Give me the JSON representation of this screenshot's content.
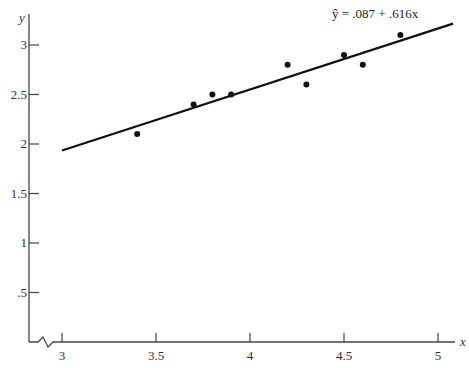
{
  "chart_data": {
    "type": "scatter",
    "title": "",
    "xlabel": "x",
    "ylabel": "y",
    "xlim": [
      3,
      5
    ],
    "ylim": [
      0,
      3
    ],
    "x_axis_break": true,
    "grid": false,
    "x_ticks": [
      3,
      3.5,
      4,
      4.5,
      5
    ],
    "x_tick_labels": [
      "3",
      "3.5",
      "4",
      "4.5",
      "5"
    ],
    "y_ticks": [
      0.5,
      1,
      1.5,
      2,
      2.5,
      3
    ],
    "y_tick_labels": [
      ".5",
      "1",
      "1.5",
      "2",
      "2.5",
      "3"
    ],
    "points": [
      {
        "x": 3.4,
        "y": 2.1
      },
      {
        "x": 3.7,
        "y": 2.4
      },
      {
        "x": 3.8,
        "y": 2.5
      },
      {
        "x": 3.9,
        "y": 2.5
      },
      {
        "x": 4.2,
        "y": 2.8
      },
      {
        "x": 4.3,
        "y": 2.6
      },
      {
        "x": 4.5,
        "y": 2.9
      },
      {
        "x": 4.6,
        "y": 2.8
      },
      {
        "x": 4.8,
        "y": 3.1
      }
    ],
    "regression_line": {
      "intercept": 0.087,
      "slope": 0.616,
      "x_range": [
        3,
        5.08
      ],
      "annotation": "ŷ = .087 + .616x"
    },
    "colors": {
      "axis": "#444444",
      "points": "#111111",
      "line": "#111111"
    }
  }
}
